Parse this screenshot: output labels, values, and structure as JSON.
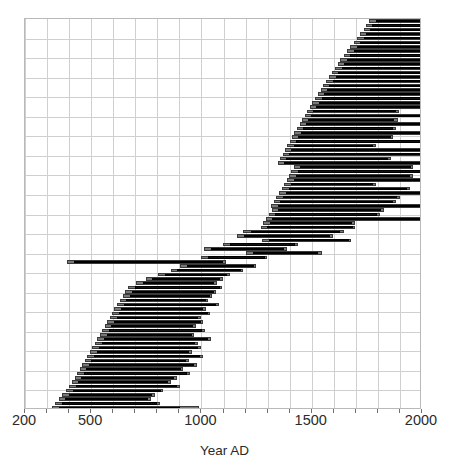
{
  "chart_data": {
    "type": "bar",
    "orientation": "horizontal",
    "subtype": "range-interval-plot",
    "title": "",
    "xlabel": "Year AD",
    "ylabel": "",
    "xlim": [
      200,
      2000
    ],
    "xticks": [
      200,
      500,
      1000,
      1500,
      2000
    ],
    "xticklabels": [
      "200",
      "500",
      "1000",
      "1500",
      "2000"
    ],
    "grid": true,
    "grid_x_step": 100,
    "grid_y_lines": 20,
    "legend": "none",
    "yaxis_visible": false,
    "series": [
      {
        "name": "Outer range (light gray)",
        "color": "#787878"
      },
      {
        "name": "Inner range (black)",
        "color": "#111111"
      }
    ],
    "row_count": 90,
    "note_units": "years AD; each row is one record with an outer (gray) span and an inner (black) span",
    "rows": [
      {
        "outer": [
          1760,
          2000
        ],
        "inner": [
          1790,
          2000
        ]
      },
      {
        "outer": [
          1745,
          2000
        ],
        "inner": [
          1775,
          2000
        ]
      },
      {
        "outer": [
          1735,
          2000
        ],
        "inner": [
          1762,
          2000
        ]
      },
      {
        "outer": [
          1720,
          2000
        ],
        "inner": [
          1748,
          2000
        ]
      },
      {
        "outer": [
          1705,
          2000
        ],
        "inner": [
          1735,
          2000
        ]
      },
      {
        "outer": [
          1690,
          2000
        ],
        "inner": [
          1720,
          2000
        ]
      },
      {
        "outer": [
          1675,
          2000
        ],
        "inner": [
          1705,
          2000
        ]
      },
      {
        "outer": [
          1660,
          2000
        ],
        "inner": [
          1690,
          2000
        ]
      },
      {
        "outer": [
          1645,
          2000
        ],
        "inner": [
          1675,
          2000
        ]
      },
      {
        "outer": [
          1630,
          2000
        ],
        "inner": [
          1660,
          2000
        ]
      },
      {
        "outer": [
          1618,
          2000
        ],
        "inner": [
          1648,
          2000
        ]
      },
      {
        "outer": [
          1605,
          2000
        ],
        "inner": [
          1635,
          2000
        ]
      },
      {
        "outer": [
          1590,
          2000
        ],
        "inner": [
          1620,
          2000
        ]
      },
      {
        "outer": [
          1578,
          2000
        ],
        "inner": [
          1608,
          2000
        ]
      },
      {
        "outer": [
          1565,
          2000
        ],
        "inner": [
          1595,
          2000
        ]
      },
      {
        "outer": [
          1550,
          2000
        ],
        "inner": [
          1580,
          2000
        ]
      },
      {
        "outer": [
          1540,
          2000
        ],
        "inner": [
          1568,
          2000
        ]
      },
      {
        "outer": [
          1528,
          2000
        ],
        "inner": [
          1556,
          2000
        ]
      },
      {
        "outer": [
          1515,
          2000
        ],
        "inner": [
          1545,
          2000
        ]
      },
      {
        "outer": [
          1502,
          2000
        ],
        "inner": [
          1532,
          2000
        ]
      },
      {
        "outer": [
          1490,
          2000
        ],
        "inner": [
          1520,
          2000
        ]
      },
      {
        "outer": [
          1478,
          1895
        ],
        "inner": [
          1508,
          1880
        ]
      },
      {
        "outer": [
          1468,
          2000
        ],
        "inner": [
          1498,
          2000
        ]
      },
      {
        "outer": [
          1455,
          1890
        ],
        "inner": [
          1485,
          1875
        ]
      },
      {
        "outer": [
          1445,
          2000
        ],
        "inner": [
          1472,
          2000
        ]
      },
      {
        "outer": [
          1432,
          1880
        ],
        "inner": [
          1462,
          1868
        ]
      },
      {
        "outer": [
          1420,
          2000
        ],
        "inner": [
          1450,
          2000
        ]
      },
      {
        "outer": [
          1410,
          1870
        ],
        "inner": [
          1440,
          1858
        ]
      },
      {
        "outer": [
          1400,
          2000
        ],
        "inner": [
          1428,
          2000
        ]
      },
      {
        "outer": [
          1390,
          1790
        ],
        "inner": [
          1418,
          1778
        ]
      },
      {
        "outer": [
          1378,
          2000
        ],
        "inner": [
          1408,
          2000
        ]
      },
      {
        "outer": [
          1368,
          2000
        ],
        "inner": [
          1396,
          2000
        ]
      },
      {
        "outer": [
          1355,
          1858
        ],
        "inner": [
          1385,
          1845
        ]
      },
      {
        "outer": [
          1345,
          2000
        ],
        "inner": [
          1375,
          2000
        ]
      },
      {
        "outer": [
          1420,
          1960
        ],
        "inner": [
          1448,
          1948
        ]
      },
      {
        "outer": [
          1408,
          2000
        ],
        "inner": [
          1438,
          2000
        ]
      },
      {
        "outer": [
          1398,
          1958
        ],
        "inner": [
          1428,
          1945
        ]
      },
      {
        "outer": [
          1388,
          2000
        ],
        "inner": [
          1418,
          2000
        ]
      },
      {
        "outer": [
          1376,
          1790
        ],
        "inner": [
          1405,
          1778
        ]
      },
      {
        "outer": [
          1365,
          1945
        ],
        "inner": [
          1395,
          1932
        ]
      },
      {
        "outer": [
          1352,
          2000
        ],
        "inner": [
          1382,
          2000
        ]
      },
      {
        "outer": [
          1340,
          1900
        ],
        "inner": [
          1370,
          1888
        ]
      },
      {
        "outer": [
          1328,
          1880
        ],
        "inner": [
          1358,
          1868
        ]
      },
      {
        "outer": [
          1315,
          2000
        ],
        "inner": [
          1345,
          2000
        ]
      },
      {
        "outer": [
          1320,
          1828
        ],
        "inner": [
          1348,
          1815
        ]
      },
      {
        "outer": [
          1305,
          1808
        ],
        "inner": [
          1335,
          1795
        ]
      },
      {
        "outer": [
          1292,
          2000
        ],
        "inner": [
          1322,
          2000
        ]
      },
      {
        "outer": [
          1280,
          1695
        ],
        "inner": [
          1310,
          1682
        ]
      },
      {
        "outer": [
          1268,
          1698
        ],
        "inner": [
          1298,
          1685
        ]
      },
      {
        "outer": [
          1190,
          1645
        ],
        "inner": [
          1225,
          1630
        ]
      },
      {
        "outer": [
          1160,
          1598
        ],
        "inner": [
          1195,
          1585
        ]
      },
      {
        "outer": [
          1275,
          1680
        ],
        "inner": [
          1305,
          1668
        ]
      },
      {
        "outer": [
          1098,
          1438
        ],
        "inner": [
          1130,
          1425
        ]
      },
      {
        "outer": [
          1010,
          1388
        ],
        "inner": [
          1045,
          1375
        ]
      },
      {
        "outer": [
          1202,
          1545
        ],
        "inner": [
          1235,
          1530
        ]
      },
      {
        "outer": [
          998,
          1298
        ],
        "inner": [
          1030,
          1288
        ]
      },
      {
        "outer": [
          390,
          1110
        ],
        "inner": [
          420,
          1098
        ]
      },
      {
        "outer": [
          905,
          1248
        ],
        "inner": [
          935,
          1238
        ]
      },
      {
        "outer": [
          860,
          1190
        ],
        "inner": [
          888,
          1178
        ]
      },
      {
        "outer": [
          805,
          1128
        ],
        "inner": [
          835,
          1115
        ]
      },
      {
        "outer": [
          748,
          1098
        ],
        "inner": [
          778,
          1085
        ]
      },
      {
        "outer": [
          705,
          1070
        ],
        "inner": [
          735,
          1058
        ]
      },
      {
        "outer": [
          668,
          1095
        ],
        "inner": [
          698,
          1082
        ]
      },
      {
        "outer": [
          655,
          1068
        ],
        "inner": [
          685,
          1055
        ]
      },
      {
        "outer": [
          645,
          1050
        ],
        "inner": [
          675,
          1038
        ]
      },
      {
        "outer": [
          630,
          1032
        ],
        "inner": [
          660,
          1020
        ]
      },
      {
        "outer": [
          618,
          1080
        ],
        "inner": [
          648,
          1068
        ]
      },
      {
        "outer": [
          605,
          1020
        ],
        "inner": [
          635,
          1008
        ]
      },
      {
        "outer": [
          595,
          1040
        ],
        "inner": [
          625,
          1028
        ]
      },
      {
        "outer": [
          585,
          998
        ],
        "inner": [
          615,
          986
        ]
      },
      {
        "outer": [
          572,
          1008
        ],
        "inner": [
          602,
          996
        ]
      },
      {
        "outer": [
          562,
          975
        ],
        "inner": [
          592,
          962
        ]
      },
      {
        "outer": [
          550,
          1015
        ],
        "inner": [
          580,
          1002
        ]
      },
      {
        "outer": [
          540,
          968
        ],
        "inner": [
          570,
          955
        ]
      },
      {
        "outer": [
          528,
          1042
        ],
        "inner": [
          558,
          1030
        ]
      },
      {
        "outer": [
          518,
          985
        ],
        "inner": [
          548,
          972
        ]
      },
      {
        "outer": [
          505,
          998
        ],
        "inner": [
          535,
          986
        ]
      },
      {
        "outer": [
          495,
          958
        ],
        "inner": [
          525,
          945
        ]
      },
      {
        "outer": [
          482,
          1005
        ],
        "inner": [
          512,
          992
        ]
      },
      {
        "outer": [
          470,
          942
        ],
        "inner": [
          500,
          930
        ]
      },
      {
        "outer": [
          458,
          980
        ],
        "inner": [
          488,
          968
        ]
      },
      {
        "outer": [
          448,
          918
        ],
        "inner": [
          478,
          906
        ]
      },
      {
        "outer": [
          438,
          948
        ],
        "inner": [
          468,
          935
        ]
      },
      {
        "outer": [
          425,
          888
        ],
        "inner": [
          455,
          875
        ]
      },
      {
        "outer": [
          412,
          862
        ],
        "inner": [
          442,
          850
        ]
      },
      {
        "outer": [
          400,
          902
        ],
        "inner": [
          430,
          890
        ]
      },
      {
        "outer": [
          388,
          828
        ],
        "inner": [
          418,
          815
        ]
      },
      {
        "outer": [
          370,
          790
        ],
        "inner": [
          400,
          778
        ]
      },
      {
        "outer": [
          352,
          770
        ],
        "inner": [
          382,
          758
        ]
      },
      {
        "outer": [
          338,
          812
        ],
        "inner": [
          368,
          800
        ]
      },
      {
        "outer": [
          322,
          990
        ],
        "inner": [
          352,
          905
        ]
      }
    ]
  },
  "axis": {
    "x_title": "Year AD",
    "x_tick_labels": [
      "200",
      "500",
      "1000",
      "1500",
      "2000"
    ]
  }
}
